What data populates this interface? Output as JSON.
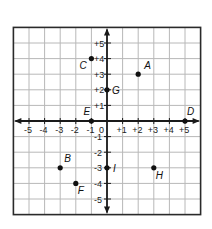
{
  "diagram": {
    "type": "coordinate-plane",
    "x_range": [
      -6,
      6
    ],
    "y_range": [
      -6,
      6
    ],
    "grid": true,
    "origin_label": "0",
    "x_tick_labels": [
      {
        "value": -5,
        "label": "-5"
      },
      {
        "value": -4,
        "label": "-4"
      },
      {
        "value": -3,
        "label": "-3"
      },
      {
        "value": -2,
        "label": "-2"
      },
      {
        "value": -1,
        "label": "-1"
      },
      {
        "value": 1,
        "label": "+1"
      },
      {
        "value": 2,
        "label": "+2"
      },
      {
        "value": 3,
        "label": "+3"
      },
      {
        "value": 4,
        "label": "+4"
      },
      {
        "value": 5,
        "label": "+5"
      }
    ],
    "y_tick_labels": [
      {
        "value": 5,
        "label": "+5"
      },
      {
        "value": 4,
        "label": "+4"
      },
      {
        "value": 3,
        "label": "+3"
      },
      {
        "value": 2,
        "label": "+2"
      },
      {
        "value": 1,
        "label": "+1"
      },
      {
        "value": -1,
        "label": "-1"
      },
      {
        "value": -2,
        "label": "-2"
      },
      {
        "value": -3,
        "label": "-3"
      },
      {
        "value": -4,
        "label": "-4"
      },
      {
        "value": -5,
        "label": "-5"
      }
    ],
    "points": [
      {
        "name": "A",
        "x": 2,
        "y": 3,
        "label_dx": 6,
        "label_dy": -5
      },
      {
        "name": "B",
        "x": -3,
        "y": -3,
        "label_dx": 4,
        "label_dy": -6
      },
      {
        "name": "C",
        "x": -1,
        "y": 4,
        "label_dx": -12,
        "label_dy": 10
      },
      {
        "name": "D",
        "x": 5,
        "y": 0,
        "label_dx": 2,
        "label_dy": -6
      },
      {
        "name": "E",
        "x": -1,
        "y": 0,
        "label_dx": -8,
        "label_dy": -6
      },
      {
        "name": "F",
        "x": -2,
        "y": -4,
        "label_dx": 2,
        "label_dy": 11
      },
      {
        "name": "G",
        "x": 0,
        "y": 2,
        "label_dx": 5,
        "label_dy": 4
      },
      {
        "name": "H",
        "x": 3,
        "y": -3,
        "label_dx": 2,
        "label_dy": 11
      },
      {
        "name": "I",
        "x": 0,
        "y": -3,
        "label_dx": 6,
        "label_dy": 4
      }
    ],
    "colors": {
      "grid": "#b8b8b8",
      "border": "#2a2a2a",
      "axis": "#1a1a1a",
      "point": "#111111"
    }
  }
}
